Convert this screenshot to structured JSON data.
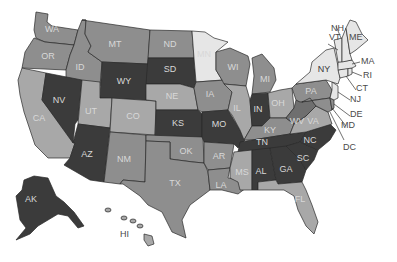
{
  "map": {
    "title": "",
    "colors": {
      "dark": "#3b3b3b",
      "medium_dark": "#6f6f6f",
      "medium": "#8e8e8e",
      "light": "#a8a8a8",
      "very_light": "#e6e6e6",
      "label_light": "#d8d8d8",
      "label_dark": "#3a3a3a"
    },
    "states": [
      {
        "abbr": "WA",
        "shade": "medium"
      },
      {
        "abbr": "OR",
        "shade": "medium"
      },
      {
        "abbr": "CA",
        "shade": "light"
      },
      {
        "abbr": "ID",
        "shade": "medium"
      },
      {
        "abbr": "NV",
        "shade": "dark"
      },
      {
        "abbr": "MT",
        "shade": "medium"
      },
      {
        "abbr": "WY",
        "shade": "dark"
      },
      {
        "abbr": "UT",
        "shade": "light"
      },
      {
        "abbr": "AZ",
        "shade": "dark"
      },
      {
        "abbr": "CO",
        "shade": "light"
      },
      {
        "abbr": "NM",
        "shade": "medium"
      },
      {
        "abbr": "ND",
        "shade": "medium"
      },
      {
        "abbr": "SD",
        "shade": "dark"
      },
      {
        "abbr": "NE",
        "shade": "light"
      },
      {
        "abbr": "KS",
        "shade": "dark"
      },
      {
        "abbr": "OK",
        "shade": "medium"
      },
      {
        "abbr": "TX",
        "shade": "medium"
      },
      {
        "abbr": "MN",
        "shade": "very_light"
      },
      {
        "abbr": "IA",
        "shade": "medium"
      },
      {
        "abbr": "MO",
        "shade": "dark"
      },
      {
        "abbr": "AR",
        "shade": "medium"
      },
      {
        "abbr": "LA",
        "shade": "medium"
      },
      {
        "abbr": "WI",
        "shade": "medium"
      },
      {
        "abbr": "IL",
        "shade": "light"
      },
      {
        "abbr": "MI",
        "shade": "medium"
      },
      {
        "abbr": "IN",
        "shade": "dark"
      },
      {
        "abbr": "OH",
        "shade": "light"
      },
      {
        "abbr": "KY",
        "shade": "medium"
      },
      {
        "abbr": "TN",
        "shade": "dark"
      },
      {
        "abbr": "MS",
        "shade": "light"
      },
      {
        "abbr": "AL",
        "shade": "dark"
      },
      {
        "abbr": "GA",
        "shade": "dark"
      },
      {
        "abbr": "FL",
        "shade": "light"
      },
      {
        "abbr": "SC",
        "shade": "dark"
      },
      {
        "abbr": "NC",
        "shade": "dark"
      },
      {
        "abbr": "VA",
        "shade": "light"
      },
      {
        "abbr": "WV",
        "shade": "medium_dark"
      },
      {
        "abbr": "PA",
        "shade": "medium"
      },
      {
        "abbr": "NY",
        "shade": "very_light"
      },
      {
        "abbr": "VT",
        "shade": "very_light"
      },
      {
        "abbr": "NH",
        "shade": "very_light"
      },
      {
        "abbr": "ME",
        "shade": "very_light"
      },
      {
        "abbr": "MA",
        "shade": "very_light"
      },
      {
        "abbr": "RI",
        "shade": "very_light"
      },
      {
        "abbr": "CT",
        "shade": "very_light"
      },
      {
        "abbr": "NJ",
        "shade": "very_light"
      },
      {
        "abbr": "DE",
        "shade": "medium"
      },
      {
        "abbr": "MD",
        "shade": "medium"
      },
      {
        "abbr": "DC",
        "shade": "dark"
      },
      {
        "abbr": "AK",
        "shade": "dark"
      },
      {
        "abbr": "HI",
        "shade": "light"
      }
    ],
    "labels": {
      "WA": "WA",
      "OR": "OR",
      "CA": "CA",
      "ID": "ID",
      "NV": "NV",
      "MT": "MT",
      "WY": "WY",
      "UT": "UT",
      "AZ": "AZ",
      "CO": "CO",
      "NM": "NM",
      "ND": "ND",
      "SD": "SD",
      "NE": "NE",
      "KS": "KS",
      "OK": "OK",
      "TX": "TX",
      "MN": "MN",
      "IA": "IA",
      "MO": "MO",
      "AR": "AR",
      "LA": "LA",
      "WI": "WI",
      "IL": "IL",
      "MI": "MI",
      "IN": "IN",
      "OH": "OH",
      "KY": "KY",
      "TN": "TN",
      "MS": "MS",
      "AL": "AL",
      "GA": "GA",
      "FL": "FL",
      "SC": "SC",
      "NC": "NC",
      "VA": "VA",
      "WV": "WV",
      "PA": "PA",
      "NY": "NY",
      "VT": "VT",
      "NH": "NH",
      "ME": "ME",
      "MA": "MA",
      "RI": "RI",
      "CT": "CT",
      "NJ": "NJ",
      "DE": "DE",
      "MD": "MD",
      "DC": "DC",
      "AK": "AK",
      "HI": "HI"
    }
  }
}
